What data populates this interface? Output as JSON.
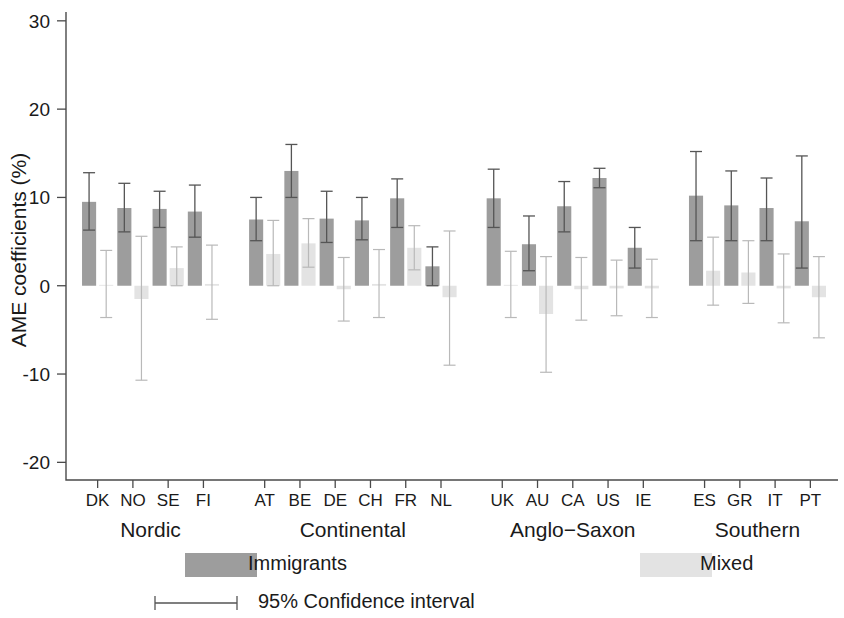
{
  "figure": {
    "width": 844,
    "height": 618,
    "background": "#ffffff"
  },
  "colors": {
    "immigrants": "#9d9d9d",
    "mixed": "#e3e3e3",
    "immigrants_ci": "#555555",
    "mixed_ci": "#bbbbbb",
    "axis": "#4a4a4a",
    "text": "#1a1a1a"
  },
  "axes": {
    "y_title": "AME coefficients (%)",
    "y_ticks": [
      30,
      20,
      10,
      0,
      -10,
      -20
    ],
    "y_tick_labels": [
      "30",
      "20",
      "10",
      "0",
      "-10",
      "-20"
    ],
    "ylim": [
      -22,
      31
    ],
    "grid": false
  },
  "legend": {
    "position": "bottom",
    "entries": [
      {
        "key": "immigrants",
        "label": "Immigrants",
        "swatch": "#9d9d9d"
      },
      {
        "key": "mixed",
        "label": "Mixed",
        "swatch": "#e3e3e3"
      }
    ],
    "ci_label": "95% Confidence interval"
  },
  "groups": [
    {
      "name": "Nordic",
      "label": "Nordic",
      "countries": [
        "DK",
        "NO",
        "SE",
        "FI"
      ]
    },
    {
      "name": "Continental",
      "label": "Continental",
      "countries": [
        "AT",
        "BE",
        "DE",
        "CH",
        "FR",
        "NL"
      ]
    },
    {
      "name": "Anglo-Saxon",
      "label": "Anglo−Saxon",
      "countries": [
        "UK",
        "AU",
        "CA",
        "US",
        "IE"
      ]
    },
    {
      "name": "Southern",
      "label": "Southern",
      "countries": [
        "ES",
        "GR",
        "IT",
        "PT"
      ]
    }
  ],
  "chart_data": {
    "type": "bar",
    "title": "",
    "subtitle": "",
    "xlabel": "",
    "ylabel": "AME coefficients (%)",
    "ylim": [
      -22,
      31
    ],
    "yticks": [
      30,
      20,
      10,
      0,
      -10,
      -20
    ],
    "grid": false,
    "legend_position": "bottom",
    "error_bars": "95% Confidence interval",
    "categories": [
      "DK",
      "NO",
      "SE",
      "FI",
      "AT",
      "BE",
      "DE",
      "CH",
      "FR",
      "NL",
      "UK",
      "AU",
      "CA",
      "US",
      "IE",
      "ES",
      "GR",
      "IT",
      "PT"
    ],
    "group_of_category": [
      "Nordic",
      "Nordic",
      "Nordic",
      "Nordic",
      "Continental",
      "Continental",
      "Continental",
      "Continental",
      "Continental",
      "Continental",
      "Anglo-Saxon",
      "Anglo-Saxon",
      "Anglo-Saxon",
      "Anglo-Saxon",
      "Anglo-Saxon",
      "Southern",
      "Southern",
      "Southern",
      "Southern"
    ],
    "series": [
      {
        "name": "Immigrants",
        "color": "#9d9d9d",
        "values": [
          9.5,
          8.8,
          8.7,
          8.4,
          7.5,
          13.0,
          7.6,
          7.4,
          9.9,
          2.2,
          9.9,
          4.7,
          9.0,
          12.2,
          4.3,
          10.2,
          9.1,
          8.8,
          7.3
        ],
        "ci_lower": [
          6.3,
          6.1,
          6.6,
          5.5,
          5.1,
          10.0,
          4.9,
          5.2,
          6.6,
          0.0,
          6.6,
          1.7,
          6.1,
          11.1,
          2.0,
          5.1,
          5.1,
          5.1,
          2.0
        ],
        "ci_upper": [
          12.8,
          11.6,
          10.7,
          11.4,
          10.0,
          16.0,
          10.7,
          10.0,
          12.1,
          4.4,
          13.2,
          7.9,
          11.8,
          13.3,
          6.6,
          15.2,
          13.0,
          12.2,
          14.7
        ]
      },
      {
        "name": "Mixed",
        "color": "#e3e3e3",
        "values": [
          0.1,
          -1.5,
          2.0,
          0.2,
          3.6,
          4.8,
          -0.4,
          0.2,
          4.3,
          -1.3,
          0.1,
          -3.2,
          -0.4,
          -0.3,
          -0.3,
          1.7,
          1.5,
          -0.3,
          -1.3
        ],
        "ci_lower": [
          -3.6,
          -10.7,
          0.0,
          -3.8,
          0.0,
          2.1,
          -4.0,
          -3.6,
          1.8,
          -9.0,
          -3.6,
          -9.8,
          -3.9,
          -3.4,
          -3.6,
          -2.2,
          -2.0,
          -4.2,
          -5.9
        ],
        "ci_upper": [
          4.0,
          5.6,
          4.4,
          4.6,
          7.4,
          7.6,
          3.2,
          4.1,
          6.8,
          6.2,
          3.9,
          3.3,
          3.2,
          2.9,
          3.0,
          5.5,
          5.1,
          3.6,
          3.3
        ]
      }
    ]
  }
}
